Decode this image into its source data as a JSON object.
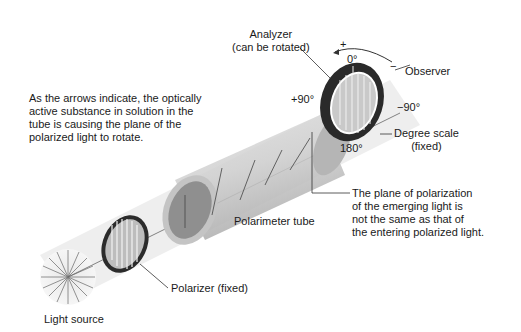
{
  "labels": {
    "analyzer_line1": "Analyzer",
    "analyzer_line2": "(can be rotated)",
    "plus": "+",
    "minus": "−",
    "zero": "0°",
    "observer": "Observer",
    "plus90": "+90°",
    "minus90": "−90°",
    "deg180": "180°",
    "degree_scale_line1": "Degree scale",
    "degree_scale_line2": "(fixed)",
    "description": [
      "As the arrows indicate, the optically",
      "active substance in solution in the",
      "tube is causing the plane of the",
      "polarized light to rotate."
    ],
    "plane_note": [
      "The plane of polarization",
      "of the emerging light is",
      "not the same as that of",
      "the entering polarized light."
    ],
    "polarimeter_tube": "Polarimeter tube",
    "polarizer": "Polarizer (fixed)",
    "light_source": "Light source"
  },
  "colors": {
    "beam": "#ececec",
    "tube": "#c8c8c8",
    "tube_dark": "#9a9a9a",
    "ring": "#2a2a2a",
    "line": "#333333"
  }
}
